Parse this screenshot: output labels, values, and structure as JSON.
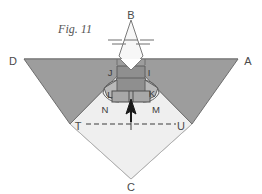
{
  "figure": {
    "caption": "Fig. 11",
    "colors": {
      "dark_gray": "#9d9d9d",
      "mid_gray": "#8f8f8f",
      "light_gray": "#efefef",
      "very_light": "#f7f7f7",
      "outline": "#6e6e6e",
      "label_text": "#4a4a4a",
      "background": "#ffffff"
    },
    "vertex_labels": [
      {
        "id": "B",
        "text": "B",
        "x": 131,
        "y": 11
      },
      {
        "id": "D",
        "text": "D",
        "x": 13,
        "y": 62
      },
      {
        "id": "A",
        "text": "A",
        "x": 248,
        "y": 62
      },
      {
        "id": "J",
        "text": "J",
        "x": 110,
        "y": 73
      },
      {
        "id": "I",
        "text": "I",
        "x": 148,
        "y": 73
      },
      {
        "id": "L",
        "text": "L",
        "x": 110,
        "y": 95
      },
      {
        "id": "K",
        "text": "K",
        "x": 151,
        "y": 94
      },
      {
        "id": "N",
        "text": "N",
        "x": 105,
        "y": 110
      },
      {
        "id": "M",
        "text": "M",
        "x": 155,
        "y": 110
      },
      {
        "id": "T",
        "text": "T",
        "x": 78,
        "y": 129
      },
      {
        "id": "U",
        "text": "U",
        "x": 180,
        "y": 129
      },
      {
        "id": "C",
        "text": "C",
        "x": 131,
        "y": 186
      }
    ]
  }
}
